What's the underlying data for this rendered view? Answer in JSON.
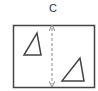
{
  "diagram": {
    "label": "C",
    "colors": {
      "stroke": "#444444",
      "arrow": "#888888",
      "background": "#ffffff"
    },
    "box": {
      "x": 13,
      "y": 25,
      "width": 81,
      "height": 62
    },
    "arrow": {
      "x": 52,
      "y1": 26,
      "y2": 86,
      "style": "dashed",
      "heads": "both"
    },
    "shapes": [
      {
        "type": "triangle",
        "name": "triangle-left",
        "points": "24,55 40,55 37,33"
      },
      {
        "type": "triangle",
        "name": "triangle-right",
        "points": "62,81 84,81 80,58"
      }
    ]
  }
}
